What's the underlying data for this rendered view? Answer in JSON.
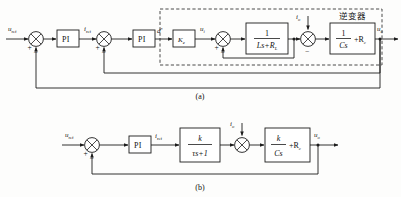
{
  "figure": {
    "captions": [
      {
        "id": "caption-a",
        "text": "(a)"
      },
      {
        "id": "caption-b",
        "text": "(b)"
      }
    ]
  },
  "colors": {
    "line": "#1c1c1c",
    "block_fill": "#ffffff",
    "background": "#fdfdfc",
    "text": "#111111"
  },
  "diagram_a": {
    "name": "double-loop-detailed",
    "dashed_group_label": "逆变器",
    "signals": {
      "input": "u",
      "input_sub": "ref",
      "current_ref": "i",
      "current_ref_sub": "ref",
      "duty": "d",
      "duty_sup": "*",
      "inverter_voltage": "u",
      "inverter_voltage_sub": "i",
      "load_current": "i",
      "load_current_sub": "o",
      "output": "u",
      "output_sub": "o"
    },
    "blocks": [
      {
        "name": "outer-pi-controller",
        "label": "PI",
        "kind": "text"
      },
      {
        "name": "inner-pi-controller",
        "label": "PI",
        "kind": "text"
      },
      {
        "name": "inverter-gain-block",
        "label": "K",
        "sub": "e",
        "kind": "gain"
      },
      {
        "name": "filter-inductor-block",
        "numerator": "1",
        "denominator": "Ls+R",
        "denominator_sub": "L",
        "kind": "fraction"
      },
      {
        "name": "filter-capacitor-block",
        "numerator": "1",
        "denominator": "Cs",
        "suffix": "+R",
        "suffix_sub": "c",
        "kind": "fraction-plus"
      }
    ],
    "summers": [
      {
        "name": "voltage-error-summer",
        "signs": [
          "+",
          "-"
        ]
      },
      {
        "name": "current-error-summer",
        "signs": [
          "+",
          "-"
        ]
      },
      {
        "name": "inductor-current-summer",
        "signs": [
          "+",
          "-"
        ]
      },
      {
        "name": "load-current-summer",
        "signs": [
          "-"
        ]
      }
    ]
  },
  "diagram_b": {
    "name": "simplified-single-loop",
    "signals": {
      "input": "u",
      "input_sub": "ref",
      "current_ref": "i",
      "current_ref_sub": "ref",
      "load_current": "i",
      "load_current_sub": "o",
      "output": "u",
      "output_sub": "o"
    },
    "blocks": [
      {
        "name": "pi-controller",
        "label": "PI",
        "kind": "text"
      },
      {
        "name": "first-order-lag-block",
        "numerator": "k",
        "denominator": "τs+1",
        "kind": "fraction"
      },
      {
        "name": "output-impedance-block",
        "numerator": "k",
        "denominator": "Cs",
        "suffix": "+R",
        "suffix_sub": "c",
        "kind": "fraction-plus"
      }
    ],
    "summers": [
      {
        "name": "voltage-error-summer",
        "signs": [
          "+",
          "-"
        ]
      },
      {
        "name": "load-current-summer",
        "signs": []
      }
    ]
  }
}
